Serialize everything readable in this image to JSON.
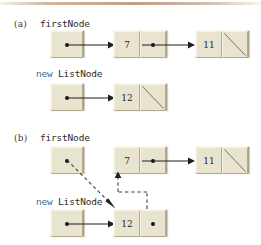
{
  "figure": {
    "panels": [
      {
        "id": "a",
        "label": "(a)",
        "pointers": [
          {
            "name": "firstNode",
            "keyword": "",
            "text": "firstNode"
          },
          {
            "name": "new-listnode",
            "keyword": "new",
            "text": "ListNode"
          }
        ],
        "nodes": [
          {
            "id": "firstNode-ref",
            "cells": [
              {
                "type": "pointer",
                "value": ""
              }
            ]
          },
          {
            "id": "node-7",
            "cells": [
              {
                "type": "data",
                "value": "7"
              },
              {
                "type": "pointer",
                "value": ""
              }
            ]
          },
          {
            "id": "node-11",
            "cells": [
              {
                "type": "data",
                "value": "11"
              },
              {
                "type": "null",
                "value": ""
              }
            ]
          },
          {
            "id": "newnode-ref",
            "cells": [
              {
                "type": "pointer",
                "value": ""
              }
            ]
          },
          {
            "id": "node-12",
            "cells": [
              {
                "type": "data",
                "value": "12"
              },
              {
                "type": "null",
                "value": ""
              }
            ]
          }
        ],
        "links": [
          {
            "from": "firstNode-ref",
            "to": "node-7",
            "style": "solid"
          },
          {
            "from": "node-7",
            "to": "node-11",
            "style": "solid"
          },
          {
            "from": "newnode-ref",
            "to": "node-12",
            "style": "solid"
          }
        ]
      },
      {
        "id": "b",
        "label": "(b)",
        "pointers": [
          {
            "name": "firstNode",
            "keyword": "",
            "text": "firstNode"
          },
          {
            "name": "new-listnode",
            "keyword": "new",
            "text": "ListNode"
          }
        ],
        "nodes": [
          {
            "id": "firstNode-ref",
            "cells": [
              {
                "type": "pointer",
                "value": ""
              }
            ]
          },
          {
            "id": "node-7",
            "cells": [
              {
                "type": "data",
                "value": "7"
              },
              {
                "type": "pointer",
                "value": ""
              }
            ]
          },
          {
            "id": "node-11",
            "cells": [
              {
                "type": "data",
                "value": "11"
              },
              {
                "type": "null",
                "value": ""
              }
            ]
          },
          {
            "id": "newnode-ref",
            "cells": [
              {
                "type": "pointer",
                "value": ""
              }
            ]
          },
          {
            "id": "node-12",
            "cells": [
              {
                "type": "data",
                "value": "12"
              },
              {
                "type": "pointer",
                "value": ""
              }
            ]
          }
        ],
        "links": [
          {
            "from": "firstNode-ref",
            "to": "node-12",
            "style": "dashed"
          },
          {
            "from": "node-12",
            "to": "node-7",
            "style": "dashed"
          },
          {
            "from": "node-7",
            "to": "node-11",
            "style": "solid"
          },
          {
            "from": "newnode-ref",
            "to": "node-12",
            "style": "solid"
          }
        ]
      }
    ],
    "colors": {
      "node_fill": "#e9e4cf",
      "node_shadow": "#a9a183",
      "keyword_blue": "#3f6fa0",
      "text": "#242424",
      "arrow": "#1f1f1f",
      "top_rule": "#b08f77"
    }
  },
  "panel_a": {
    "label": "(a)",
    "first_node_label": "firstNode",
    "new_keyword": "new",
    "new_type": "ListNode",
    "value_7": "7",
    "value_11": "11",
    "value_12": "12"
  },
  "panel_b": {
    "label": "(b)",
    "first_node_label": "firstNode",
    "new_keyword": "new",
    "new_type": "ListNode",
    "value_7": "7",
    "value_11": "11",
    "value_12": "12"
  }
}
